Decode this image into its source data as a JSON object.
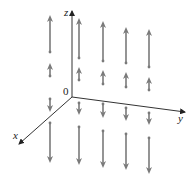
{
  "figure": {
    "type": "3d-vector-field",
    "axes": {
      "x_label": "x",
      "y_label": "y",
      "z_label": "z",
      "origin_label": "0"
    },
    "arrow_color": "#7a7a7a",
    "axis_color": "#333333",
    "columns": [
      {
        "x": 50,
        "arrows": [
          [
            52,
            15
          ],
          [
            76,
            63
          ],
          [
            99,
            112
          ],
          [
            123,
            163
          ]
        ]
      },
      {
        "x": 79,
        "arrows": [
          [
            58,
            18
          ],
          [
            80,
            67
          ],
          [
            103,
            115
          ],
          [
            127,
            165
          ]
        ]
      },
      {
        "x": 103,
        "arrows": [
          [
            61,
            21
          ],
          [
            84,
            70
          ],
          [
            104,
            118
          ],
          [
            131,
            168
          ]
        ]
      },
      {
        "x": 126,
        "arrows": [
          [
            63,
            27
          ],
          [
            87,
            72
          ],
          [
            108,
            121
          ],
          [
            134,
            170
          ]
        ]
      },
      {
        "x": 149,
        "arrows": [
          [
            67,
            29
          ],
          [
            90,
            77
          ],
          [
            113,
            125
          ],
          [
            138,
            174
          ]
        ]
      }
    ]
  }
}
